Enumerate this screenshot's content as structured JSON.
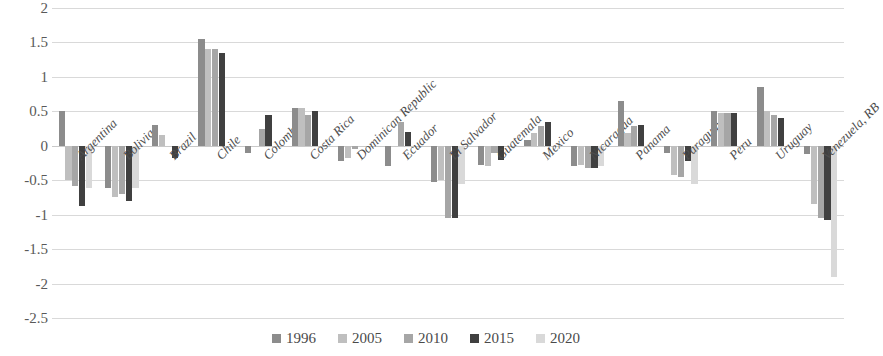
{
  "chart_data": {
    "type": "bar",
    "title": "",
    "subtitle": "",
    "xlabel": "",
    "ylabel": "",
    "ylim": [
      -2.5,
      2
    ],
    "ytick_values": [
      2,
      1.5,
      1,
      0.5,
      0,
      -0.5,
      -1,
      -1.5,
      -2,
      -2.5
    ],
    "ytick_labels": [
      "2",
      "1.5",
      "1",
      "0.5",
      "0",
      "-0.5",
      "-1",
      "-1.5",
      "-2",
      "-2.5"
    ],
    "grid": true,
    "legend_position": "bottom",
    "categories": [
      "Argentina",
      "Bolivia",
      "Brazil",
      "Chile",
      "Colombia",
      "Costa Rica",
      "Dominican Republic",
      "Ecuador",
      "El Salvador",
      "Guatemala",
      "Mexico",
      "Nicaragua",
      "Panama",
      "Paraguay",
      "Peru",
      "Uruguay",
      "Venezuela, RB"
    ],
    "series": [
      {
        "name": "1996",
        "color": "#8c8c8c",
        "values": [
          0.5,
          -0.62,
          0.3,
          1.55,
          -0.1,
          0.55,
          -0.22,
          -0.3,
          -0.52,
          -0.28,
          0.08,
          -0.3,
          0.65,
          -0.1,
          0.5,
          0.85,
          -0.12
        ]
      },
      {
        "name": "2005",
        "color": "#bfbfbf",
        "values": [
          -0.5,
          -0.75,
          0.16,
          1.4,
          0.0,
          0.55,
          -0.18,
          0.0,
          -0.5,
          -0.3,
          0.18,
          -0.28,
          0.18,
          -0.42,
          0.48,
          0.5,
          -0.85
        ]
      },
      {
        "name": "2010",
        "color": "#a6a6a6",
        "values": [
          -0.58,
          -0.7,
          0.0,
          1.4,
          0.25,
          0.45,
          -0.05,
          0.35,
          -1.05,
          -0.1,
          0.28,
          -0.32,
          0.28,
          -0.45,
          0.48,
          0.45,
          -1.05
        ]
      },
      {
        "name": "2015",
        "color": "#404040",
        "values": [
          -0.88,
          -0.8,
          -0.18,
          1.35,
          0.45,
          0.5,
          0.0,
          0.2,
          -1.05,
          -0.2,
          0.35,
          -0.33,
          0.3,
          -0.22,
          0.48,
          0.4,
          -1.08
        ]
      },
      {
        "name": "2020",
        "color": "#d9d9d9",
        "values": [
          -0.62,
          -0.62,
          0.0,
          0.0,
          0.0,
          0.0,
          0.0,
          0.0,
          -0.55,
          0.0,
          0.0,
          -0.3,
          0.0,
          -0.55,
          0.0,
          0.0,
          -1.9
        ]
      }
    ]
  },
  "legend": {
    "items": [
      {
        "label": "1996"
      },
      {
        "label": "2005"
      },
      {
        "label": "2010"
      },
      {
        "label": "2015"
      },
      {
        "label": "2020"
      }
    ]
  }
}
